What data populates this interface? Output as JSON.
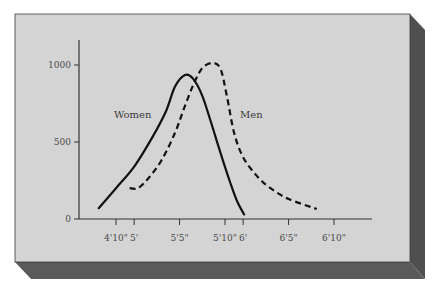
{
  "chart_data": {
    "type": "line",
    "title": "",
    "xlabel": "Height",
    "ylabel": "Count",
    "ylim": [
      0,
      1100
    ],
    "xlim_inches": [
      54,
      83
    ],
    "grid": false,
    "legend_position": "inline labels",
    "y_ticks": [
      {
        "value": 0,
        "label": "0"
      },
      {
        "value": 500,
        "label": "500"
      },
      {
        "value": 1000,
        "label": "1000"
      }
    ],
    "x_ticks": [
      {
        "inches": 58,
        "label": "4'10\""
      },
      {
        "inches": 60,
        "label": "5'"
      },
      {
        "inches": 65,
        "label": "5'5\""
      },
      {
        "inches": 70,
        "label": "5'10\""
      },
      {
        "inches": 72,
        "label": "6'"
      },
      {
        "inches": 77,
        "label": "6'5\""
      },
      {
        "inches": 82,
        "label": "6'10\""
      }
    ],
    "series": [
      {
        "name": "Women",
        "style": "solid",
        "label": "Women",
        "x_inches": [
          56.1,
          58,
          60,
          62,
          63.5,
          64.5,
          65.6,
          66.5,
          67.5,
          68.5,
          69.5,
          70.5,
          71.3,
          72.1
        ],
        "values": [
          70,
          200,
          340,
          530,
          700,
          860,
          935,
          910,
          800,
          620,
          430,
          250,
          120,
          30
        ]
      },
      {
        "name": "Men",
        "style": "dashed",
        "label": "Men",
        "x_inches": [
          59.5,
          60.4,
          61.5,
          63,
          64.5,
          65.5,
          66.5,
          67.5,
          68.6,
          69.5,
          70.2,
          71,
          72,
          73.5,
          75,
          77,
          80.1
        ],
        "values": [
          200,
          200,
          260,
          380,
          560,
          720,
          870,
          980,
          1013,
          975,
          800,
          560,
          400,
          280,
          200,
          130,
          65
        ]
      }
    ]
  },
  "labels": {
    "women": "Women",
    "men": "Men"
  }
}
